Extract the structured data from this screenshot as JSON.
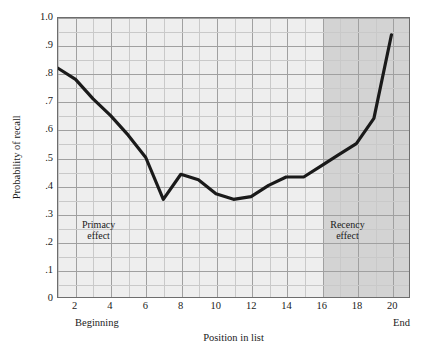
{
  "chart_data": {
    "type": "line",
    "title": "",
    "xlabel": "Position in list",
    "ylabel": "Probability of recall",
    "xlim": [
      1,
      20
    ],
    "ylim": [
      0,
      1.0
    ],
    "grid": true,
    "legend": "none",
    "x": [
      1,
      2,
      3,
      4,
      5,
      6,
      7,
      8,
      9,
      10,
      11,
      12,
      13,
      14,
      15,
      16,
      17,
      18,
      19,
      20
    ],
    "values": [
      0.82,
      0.78,
      0.71,
      0.65,
      0.58,
      0.5,
      0.35,
      0.44,
      0.42,
      0.37,
      0.35,
      0.36,
      0.4,
      0.43,
      0.43,
      0.47,
      0.51,
      0.55,
      0.64,
      0.94
    ],
    "series": [
      {
        "name": "Probability of recall",
        "values": [
          0.82,
          0.78,
          0.71,
          0.65,
          0.58,
          0.5,
          0.35,
          0.44,
          0.42,
          0.37,
          0.35,
          0.36,
          0.4,
          0.43,
          0.43,
          0.47,
          0.51,
          0.55,
          0.64,
          0.94
        ]
      }
    ],
    "ytick_labels": [
      "1.0",
      ".9",
      ".8",
      ".7",
      ".6",
      ".5",
      ".4",
      ".3",
      ".2",
      ".1",
      "0"
    ],
    "ytick_values": [
      1.0,
      0.9,
      0.8,
      0.7,
      0.6,
      0.5,
      0.4,
      0.3,
      0.2,
      0.1,
      0.0
    ],
    "xtick_labels": [
      "2",
      "4",
      "6",
      "8",
      "10",
      "12",
      "14",
      "16",
      "18",
      "20"
    ],
    "xtick_values": [
      2,
      4,
      6,
      8,
      10,
      12,
      14,
      16,
      18,
      20
    ],
    "annotations": [
      {
        "label": "Primacy\neffect",
        "x": 3.3,
        "y": 0.245
      },
      {
        "label": "Recency\neffect",
        "x": 17.4,
        "y": 0.245
      }
    ],
    "shaded_region": {
      "label": "recency-band",
      "x_start": 16,
      "x_end": 20,
      "color": "#d3d3d3"
    }
  },
  "axes": {
    "x_title": "Position in list",
    "y_title": "Probability of recall",
    "x_end_labels": {
      "left": "Beginning",
      "right": "End"
    }
  },
  "colors": {
    "plot_background": "#eeeeee",
    "shaded_band": "#d3d3d3",
    "grid_minor": "#c9c9c9",
    "grid_major": "#a0a0a0",
    "frame": "#6d6d6d",
    "curve": "#1a1a1a",
    "text": "#1a1a1a"
  }
}
